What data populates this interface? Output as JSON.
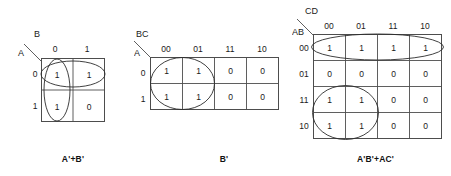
{
  "figure": {
    "background_color": "#ffffff",
    "line_color": "#4d4d4d",
    "group_color": "#2b2b2b",
    "text_color": "#1a1a1a"
  },
  "kmaps": [
    {
      "id": "kmap-2var",
      "caption": "A'+B'",
      "row_variable": "A",
      "col_variable": "B",
      "col_headers": [
        "0",
        "1"
      ],
      "row_headers": [
        "0",
        "1"
      ],
      "cells": [
        [
          "1",
          "1"
        ],
        [
          "1",
          "0"
        ]
      ],
      "groups": [
        {
          "name": "group-top-row",
          "shape": "ellipse",
          "covers": "row 0, columns 0 and 1"
        },
        {
          "name": "group-left-column",
          "shape": "ellipse",
          "covers": "column 0, rows 0 and 1"
        }
      ]
    },
    {
      "id": "kmap-3var",
      "caption": "B'",
      "row_variable": "A",
      "col_variable": "BC",
      "col_headers": [
        "00",
        "01",
        "11",
        "10"
      ],
      "row_headers": [
        "0",
        "1"
      ],
      "cells": [
        [
          "1",
          "1",
          "0",
          "0"
        ],
        [
          "1",
          "1",
          "0",
          "0"
        ]
      ],
      "groups": [
        {
          "name": "group-left-block",
          "shape": "circle",
          "covers": "columns 00 and 01, rows 0 and 1"
        }
      ]
    },
    {
      "id": "kmap-4var",
      "caption": "A'B'+AC'",
      "row_variable": "AB",
      "col_variable": "CD",
      "col_headers": [
        "00",
        "01",
        "11",
        "10"
      ],
      "row_headers": [
        "00",
        "01",
        "11",
        "10"
      ],
      "cells": [
        [
          "1",
          "1",
          "1",
          "1"
        ],
        [
          "0",
          "0",
          "0",
          "0"
        ],
        [
          "1",
          "1",
          "0",
          "0"
        ],
        [
          "1",
          "1",
          "0",
          "0"
        ]
      ],
      "groups": [
        {
          "name": "group-top-row",
          "shape": "ellipse",
          "covers": "row 00, all four columns"
        },
        {
          "name": "group-bottom-left-block",
          "shape": "circle",
          "covers": "rows 11 and 10, columns 00 and 01"
        }
      ]
    }
  ]
}
